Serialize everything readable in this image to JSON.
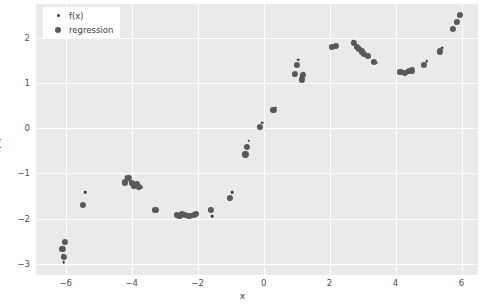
{
  "chart_data": {
    "type": "scatter",
    "title": "",
    "xlabel": "x",
    "ylabel": "f(x)",
    "xlim": [
      -6.9,
      6.5
    ],
    "ylim": [
      -3.25,
      2.75
    ],
    "xticks": [
      -6,
      -4,
      -2,
      0,
      2,
      4,
      6
    ],
    "xticklabels": [
      "−6",
      "−4",
      "−2",
      "0",
      "2",
      "4",
      "6"
    ],
    "yticks": [
      2,
      1,
      0,
      -1,
      -2,
      -3
    ],
    "yticklabels": [
      "2",
      "1",
      "0",
      "−1",
      "−2",
      "−3"
    ],
    "grid": true,
    "grid_color": "#ffffff",
    "plot_bgcolor": "#eaeaea",
    "legend_position": "upper left",
    "series": [
      {
        "name": "f(x)",
        "marker": "small-dot",
        "color": "#3b3b3b",
        "size": 2.6,
        "points": [
          [
            -6.12,
            -2.62
          ],
          [
            -6.09,
            -2.8
          ],
          [
            -6.06,
            -2.97
          ],
          [
            -6.02,
            -2.56
          ],
          [
            -5.45,
            -1.72
          ],
          [
            -5.4,
            -1.42
          ],
          [
            -4.22,
            -1.22
          ],
          [
            -4.18,
            -1.08
          ],
          [
            -4.05,
            -1.18
          ],
          [
            -3.95,
            -1.3
          ],
          [
            -3.88,
            -1.25
          ],
          [
            -3.8,
            -1.33
          ],
          [
            -3.7,
            -1.3
          ],
          [
            -3.25,
            -1.82
          ],
          [
            -2.6,
            -1.92
          ],
          [
            -2.52,
            -1.95
          ],
          [
            -2.45,
            -1.9
          ],
          [
            -2.35,
            -1.93
          ],
          [
            -2.2,
            -1.95
          ],
          [
            -2.1,
            -1.92
          ],
          [
            -2.02,
            -1.88
          ],
          [
            -1.62,
            -1.78
          ],
          [
            -1.55,
            -1.95
          ],
          [
            -1.05,
            -1.58
          ],
          [
            -0.95,
            -1.42
          ],
          [
            -0.52,
            -0.55
          ],
          [
            -0.48,
            -0.4
          ],
          [
            -0.45,
            -0.28
          ],
          [
            -0.12,
            0.05
          ],
          [
            -0.05,
            0.12
          ],
          [
            0.28,
            0.38
          ],
          [
            0.35,
            0.45
          ],
          [
            0.92,
            1.18
          ],
          [
            0.98,
            1.38
          ],
          [
            1.05,
            1.52
          ],
          [
            1.12,
            1.05
          ],
          [
            1.18,
            1.12
          ],
          [
            1.22,
            1.22
          ],
          [
            2.05,
            1.78
          ],
          [
            2.18,
            1.82
          ],
          [
            2.72,
            1.92
          ],
          [
            2.8,
            1.82
          ],
          [
            2.88,
            1.78
          ],
          [
            2.95,
            1.72
          ],
          [
            3.02,
            1.65
          ],
          [
            3.12,
            1.62
          ],
          [
            3.2,
            1.58
          ],
          [
            3.32,
            1.48
          ],
          [
            3.42,
            1.45
          ],
          [
            4.12,
            1.25
          ],
          [
            4.25,
            1.22
          ],
          [
            4.35,
            1.25
          ],
          [
            4.48,
            1.28
          ],
          [
            4.82,
            1.38
          ],
          [
            4.95,
            1.48
          ],
          [
            5.32,
            1.68
          ],
          [
            5.42,
            1.78
          ],
          [
            5.72,
            2.18
          ],
          [
            5.82,
            2.32
          ],
          [
            5.92,
            2.48
          ]
        ]
      },
      {
        "name": "regression",
        "marker": "large-dot",
        "color": "#59595b",
        "size": 6.2,
        "points": [
          [
            -6.1,
            -2.68
          ],
          [
            -6.05,
            -2.85
          ],
          [
            -6.02,
            -2.52
          ],
          [
            -5.48,
            -1.7
          ],
          [
            -4.2,
            -1.2
          ],
          [
            -4.1,
            -1.1
          ],
          [
            -4.0,
            -1.22
          ],
          [
            -3.92,
            -1.28
          ],
          [
            -3.85,
            -1.24
          ],
          [
            -3.78,
            -1.3
          ],
          [
            -3.28,
            -1.8
          ],
          [
            -2.62,
            -1.92
          ],
          [
            -2.55,
            -1.94
          ],
          [
            -2.48,
            -1.9
          ],
          [
            -2.38,
            -1.92
          ],
          [
            -2.25,
            -1.94
          ],
          [
            -2.12,
            -1.92
          ],
          [
            -2.05,
            -1.9
          ],
          [
            -1.6,
            -1.8
          ],
          [
            -1.02,
            -1.55
          ],
          [
            -0.55,
            -0.58
          ],
          [
            -0.5,
            -0.42
          ],
          [
            -0.1,
            0.02
          ],
          [
            0.3,
            0.4
          ],
          [
            0.95,
            1.2
          ],
          [
            1.0,
            1.4
          ],
          [
            1.15,
            1.08
          ],
          [
            1.2,
            1.18
          ],
          [
            2.08,
            1.8
          ],
          [
            2.2,
            1.82
          ],
          [
            2.75,
            1.88
          ],
          [
            2.82,
            1.8
          ],
          [
            2.9,
            1.76
          ],
          [
            2.98,
            1.7
          ],
          [
            3.05,
            1.64
          ],
          [
            3.15,
            1.6
          ],
          [
            3.35,
            1.46
          ],
          [
            4.15,
            1.24
          ],
          [
            4.28,
            1.22
          ],
          [
            4.4,
            1.26
          ],
          [
            4.5,
            1.28
          ],
          [
            4.85,
            1.4
          ],
          [
            5.35,
            1.7
          ],
          [
            5.75,
            2.2
          ],
          [
            5.85,
            2.35
          ],
          [
            5.95,
            2.5
          ]
        ]
      }
    ],
    "legend": [
      {
        "label": "f(x)",
        "marker": "small-dot",
        "color": "#3b3b3b"
      },
      {
        "label": "regression",
        "marker": "large-dot",
        "color": "#59595b"
      }
    ]
  }
}
